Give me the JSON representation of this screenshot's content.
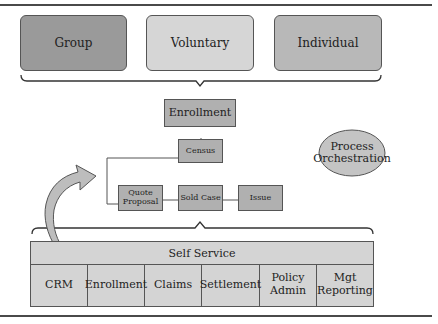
{
  "segments": [
    {
      "label": "Group",
      "color": "#9a9a9a"
    },
    {
      "label": "Voluntary",
      "color": "#d6d6d6"
    },
    {
      "label": "Individual",
      "color": "#b8b8b8"
    }
  ],
  "enrollment": {
    "label": "Enrollment",
    "color": "#b0b0b0"
  },
  "census": {
    "label": "Census"
  },
  "process_steps": [
    {
      "label": "Quote Proposal"
    },
    {
      "label": "Sold Case"
    },
    {
      "label": "Issue"
    }
  ],
  "orchestration": {
    "label": "Process Orchestration",
    "color": "#c4c4c4"
  },
  "self_service": {
    "label": "Self Service",
    "color": "#d4d4d4"
  },
  "modules": [
    {
      "label": "CRM"
    },
    {
      "label": "Enrollment"
    },
    {
      "label": "Claims"
    },
    {
      "label": "Settlement"
    },
    {
      "label": "Policy Admin"
    },
    {
      "label": "Mgt Reporting"
    }
  ]
}
